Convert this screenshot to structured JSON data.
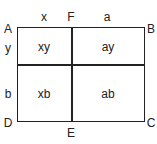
{
  "diagram": {
    "vertices": {
      "A": "A",
      "B": "B",
      "C": "C",
      "D": "D",
      "E": "E",
      "F": "F"
    },
    "segments": {
      "top_left": "x",
      "top_right": "a",
      "left_top": "y",
      "left_bottom": "b"
    },
    "regions": {
      "top_left": "xy",
      "top_right": "ay",
      "bottom_left": "xb",
      "bottom_right": "ab"
    }
  }
}
